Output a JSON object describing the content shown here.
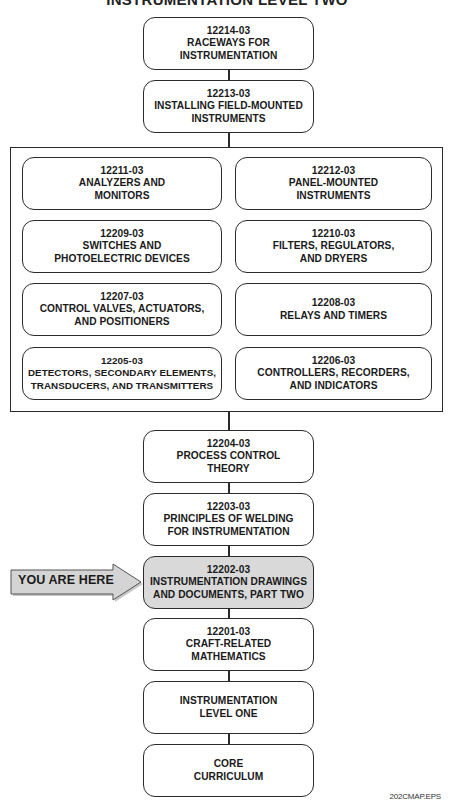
{
  "title": "INSTRUMENTATION LEVEL TWO",
  "colors": {
    "line": "#2a2a2a",
    "highlight_fill": "#d9d9d9",
    "arrow_fill": "#d4d4d4",
    "background": "#ffffff"
  },
  "top_stack": [
    {
      "code": "12214-03",
      "lines": [
        "RACEWAYS FOR",
        "INSTRUMENTATION"
      ]
    },
    {
      "code": "12213-03",
      "lines": [
        "INSTALLING FIELD-MOUNTED",
        "INSTRUMENTS"
      ]
    }
  ],
  "grouped_modules": [
    {
      "code": "12211-03",
      "lines": [
        "ANALYZERS AND",
        "MONITORS"
      ]
    },
    {
      "code": "12212-03",
      "lines": [
        "PANEL-MOUNTED",
        "INSTRUMENTS"
      ]
    },
    {
      "code": "12209-03",
      "lines": [
        "SWITCHES AND",
        "PHOTOELECTRIC DEVICES"
      ]
    },
    {
      "code": "12210-03",
      "lines": [
        "FILTERS, REGULATORS,",
        "AND DRYERS"
      ]
    },
    {
      "code": "12207-03",
      "lines": [
        "CONTROL VALVES, ACTUATORS,",
        "AND POSITIONERS"
      ]
    },
    {
      "code": "12208-03",
      "lines": [
        "RELAYS AND TIMERS"
      ]
    },
    {
      "code": "12205-03",
      "lines": [
        "DETECTORS, SECONDARY ELEMENTS,",
        "TRANSDUCERS, AND TRANSMITTERS"
      ]
    },
    {
      "code": "12206-03",
      "lines": [
        "CONTROLLERS, RECORDERS,",
        "AND INDICATORS"
      ]
    }
  ],
  "bottom_stack": [
    {
      "code": "12204-03",
      "lines": [
        "PROCESS CONTROL",
        "THEORY"
      ]
    },
    {
      "code": "12203-03",
      "lines": [
        "PRINCIPLES OF WELDING",
        "FOR INSTRUMENTATION"
      ]
    },
    {
      "code": "12202-03",
      "lines": [
        "INSTRUMENTATION DRAWINGS",
        "AND DOCUMENTS, PART TWO"
      ],
      "highlighted": true
    },
    {
      "code": "12201-03",
      "lines": [
        "CRAFT-RELATED",
        "MATHEMATICS"
      ]
    },
    {
      "code": "",
      "lines": [
        "INSTRUMENTATION",
        "LEVEL ONE"
      ]
    },
    {
      "code": "",
      "lines": [
        "CORE",
        "CURRICULUM"
      ]
    }
  ],
  "you_are_here": {
    "label": "YOU ARE HERE",
    "icon": "right-arrow-icon"
  },
  "filename": "202CMAP.EPS"
}
